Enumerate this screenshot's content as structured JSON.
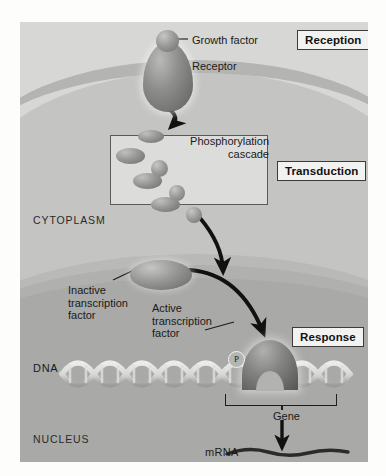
{
  "figure": {
    "background_color": "#c9c9c9"
  },
  "stages": [
    {
      "id": "reception",
      "label": "Reception"
    },
    {
      "id": "transduction",
      "label": "Transduction"
    },
    {
      "id": "response",
      "label": "Response"
    }
  ],
  "compartments": {
    "cytoplasm": "CYTOPLASM",
    "nucleus": "NUCLEUS"
  },
  "labels": {
    "growth_factor": "Growth factor",
    "receptor": "Receptor",
    "phosphorylation_cascade": "Phosphorylation\ncascade",
    "inactive_transcription_factor": "Inactive\ntranscription\nfactor",
    "active_transcription_factor": "Active\ntranscription\nfactor",
    "dna": "DNA",
    "gene": "Gene",
    "mrna": "mRNA",
    "phosphate": "P"
  },
  "cascade": {
    "steps": [
      {
        "kinase": "kinase-ellipse-1",
        "target": "kinase-sphere-1"
      },
      {
        "kinase": "kinase-ellipse-2",
        "target": "kinase-sphere-2"
      },
      {
        "kinase": "kinase-ellipse-3",
        "target": "kinase-sphere-3"
      }
    ]
  },
  "colors": {
    "extracellular": "#d7d7d5",
    "membrane": "#b4b4b2",
    "cytoplasm": "#c4c4c2",
    "nucleus": "#a9a9a7",
    "cascade_box": "#dcdcda",
    "label_box": "#f2f2f0",
    "outline": "#3b3b3b",
    "arrow": "#111111"
  }
}
